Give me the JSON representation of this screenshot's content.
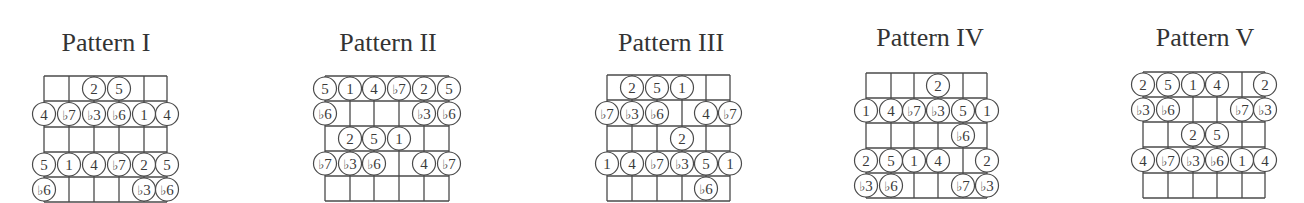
{
  "patterns": [
    {
      "title": "Pattern I",
      "title_x": 106,
      "title_y": 30,
      "strings_x": [
        44,
        69,
        94,
        119,
        144,
        167
      ],
      "frets_y": [
        76,
        101,
        127,
        152,
        177,
        202
      ],
      "notes": [
        {
          "fret": 1,
          "string": 3,
          "label": "2"
        },
        {
          "fret": 1,
          "string": 4,
          "label": "5"
        },
        {
          "fret": 2,
          "string": 1,
          "label": "4"
        },
        {
          "fret": 2,
          "string": 2,
          "label": "b7"
        },
        {
          "fret": 2,
          "string": 3,
          "label": "b3"
        },
        {
          "fret": 2,
          "string": 4,
          "label": "b6"
        },
        {
          "fret": 2,
          "string": 5,
          "label": "1"
        },
        {
          "fret": 2,
          "string": 6,
          "label": "4"
        },
        {
          "fret": 4,
          "string": 1,
          "label": "5"
        },
        {
          "fret": 4,
          "string": 2,
          "label": "1"
        },
        {
          "fret": 4,
          "string": 3,
          "label": "4"
        },
        {
          "fret": 4,
          "string": 4,
          "label": "b7"
        },
        {
          "fret": 4,
          "string": 5,
          "label": "2"
        },
        {
          "fret": 4,
          "string": 6,
          "label": "5"
        },
        {
          "fret": 5,
          "string": 1,
          "label": "b6"
        },
        {
          "fret": 5,
          "string": 5,
          "label": "b3"
        },
        {
          "fret": 5,
          "string": 6,
          "label": "b6"
        }
      ]
    },
    {
      "title": "Pattern II",
      "title_x": 388,
      "title_y": 30,
      "strings_x": [
        325,
        350,
        374,
        399,
        424,
        449
      ],
      "frets_y": [
        76,
        101,
        126,
        151,
        176,
        201
      ],
      "notes": [
        {
          "fret": 1,
          "string": 1,
          "label": "5"
        },
        {
          "fret": 1,
          "string": 2,
          "label": "1"
        },
        {
          "fret": 1,
          "string": 3,
          "label": "4"
        },
        {
          "fret": 1,
          "string": 4,
          "label": "b7"
        },
        {
          "fret": 1,
          "string": 5,
          "label": "2"
        },
        {
          "fret": 1,
          "string": 6,
          "label": "5"
        },
        {
          "fret": 2,
          "string": 1,
          "label": "b6"
        },
        {
          "fret": 2,
          "string": 5,
          "label": "b3"
        },
        {
          "fret": 2,
          "string": 6,
          "label": "b6"
        },
        {
          "fret": 3,
          "string": 2,
          "label": "2"
        },
        {
          "fret": 3,
          "string": 3,
          "label": "5"
        },
        {
          "fret": 3,
          "string": 4,
          "label": "1"
        },
        {
          "fret": 4,
          "string": 1,
          "label": "b7"
        },
        {
          "fret": 4,
          "string": 2,
          "label": "b3"
        },
        {
          "fret": 4,
          "string": 3,
          "label": "b6"
        },
        {
          "fret": 4,
          "string": 5,
          "label": "4"
        },
        {
          "fret": 4,
          "string": 6,
          "label": "b7"
        }
      ]
    },
    {
      "title": "Pattern III",
      "title_x": 671,
      "title_y": 30,
      "strings_x": [
        607,
        632,
        657,
        682,
        706,
        730
      ],
      "frets_y": [
        75,
        100,
        126,
        151,
        176,
        201
      ],
      "notes": [
        {
          "fret": 1,
          "string": 2,
          "label": "2"
        },
        {
          "fret": 1,
          "string": 3,
          "label": "5"
        },
        {
          "fret": 1,
          "string": 4,
          "label": "1"
        },
        {
          "fret": 2,
          "string": 1,
          "label": "b7"
        },
        {
          "fret": 2,
          "string": 2,
          "label": "b3"
        },
        {
          "fret": 2,
          "string": 3,
          "label": "b6"
        },
        {
          "fret": 2,
          "string": 5,
          "label": "4"
        },
        {
          "fret": 2,
          "string": 6,
          "label": "b7"
        },
        {
          "fret": 3,
          "string": 4,
          "label": "2"
        },
        {
          "fret": 4,
          "string": 1,
          "label": "1"
        },
        {
          "fret": 4,
          "string": 2,
          "label": "4"
        },
        {
          "fret": 4,
          "string": 3,
          "label": "b7"
        },
        {
          "fret": 4,
          "string": 4,
          "label": "b3"
        },
        {
          "fret": 4,
          "string": 5,
          "label": "5"
        },
        {
          "fret": 4,
          "string": 6,
          "label": "1"
        },
        {
          "fret": 5,
          "string": 5,
          "label": "b6"
        }
      ]
    },
    {
      "title": "Pattern IV",
      "title_x": 930,
      "title_y": 25,
      "strings_x": [
        866,
        891,
        914,
        938,
        963,
        987
      ],
      "frets_y": [
        73,
        98,
        123,
        148,
        173,
        198
      ],
      "notes": [
        {
          "fret": 1,
          "string": 4,
          "label": "2"
        },
        {
          "fret": 2,
          "string": 1,
          "label": "1"
        },
        {
          "fret": 2,
          "string": 2,
          "label": "4"
        },
        {
          "fret": 2,
          "string": 3,
          "label": "b7"
        },
        {
          "fret": 2,
          "string": 4,
          "label": "b3"
        },
        {
          "fret": 2,
          "string": 5,
          "label": "5"
        },
        {
          "fret": 2,
          "string": 6,
          "label": "1"
        },
        {
          "fret": 3,
          "string": 5,
          "label": "b6"
        },
        {
          "fret": 4,
          "string": 1,
          "label": "2"
        },
        {
          "fret": 4,
          "string": 2,
          "label": "5"
        },
        {
          "fret": 4,
          "string": 3,
          "label": "1"
        },
        {
          "fret": 4,
          "string": 4,
          "label": "4"
        },
        {
          "fret": 4,
          "string": 6,
          "label": "2"
        },
        {
          "fret": 5,
          "string": 1,
          "label": "b3"
        },
        {
          "fret": 5,
          "string": 2,
          "label": "b6"
        },
        {
          "fret": 5,
          "string": 5,
          "label": "b7"
        },
        {
          "fret": 5,
          "string": 6,
          "label": "b3"
        }
      ]
    },
    {
      "title": "Pattern V",
      "title_x": 1205,
      "title_y": 25,
      "strings_x": [
        1143,
        1168,
        1193,
        1217,
        1242,
        1265
      ],
      "frets_y": [
        72,
        97,
        122,
        147,
        173,
        198
      ],
      "notes": [
        {
          "fret": 1,
          "string": 1,
          "label": "2"
        },
        {
          "fret": 1,
          "string": 2,
          "label": "5"
        },
        {
          "fret": 1,
          "string": 3,
          "label": "1"
        },
        {
          "fret": 1,
          "string": 4,
          "label": "4"
        },
        {
          "fret": 1,
          "string": 6,
          "label": "2"
        },
        {
          "fret": 2,
          "string": 1,
          "label": "b3"
        },
        {
          "fret": 2,
          "string": 2,
          "label": "b6"
        },
        {
          "fret": 2,
          "string": 5,
          "label": "b7"
        },
        {
          "fret": 2,
          "string": 6,
          "label": "b3"
        },
        {
          "fret": 3,
          "string": 3,
          "label": "2"
        },
        {
          "fret": 3,
          "string": 4,
          "label": "5"
        },
        {
          "fret": 4,
          "string": 1,
          "label": "4"
        },
        {
          "fret": 4,
          "string": 2,
          "label": "b7"
        },
        {
          "fret": 4,
          "string": 3,
          "label": "b3"
        },
        {
          "fret": 4,
          "string": 4,
          "label": "b6"
        },
        {
          "fret": 4,
          "string": 5,
          "label": "1"
        },
        {
          "fret": 4,
          "string": 6,
          "label": "4"
        }
      ]
    }
  ],
  "style": {
    "line_color": "#4a4a4a",
    "text_color": "#333333",
    "circle_fill": "#ffffff",
    "note_radius": 11.5,
    "flat_symbol": "♭"
  }
}
